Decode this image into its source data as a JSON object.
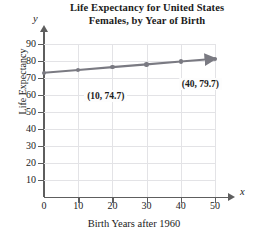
{
  "chart_data": {
    "type": "line",
    "title": "Life Expectancy for United States Females, by Year of Birth",
    "title_line1": "Life Expectancy for United States",
    "title_line2": "Females, by Year of Birth",
    "xlabel": "Birth Years after 1960",
    "ylabel": "Life Expectancy",
    "x_axis_symbol": "x",
    "y_axis_symbol": "y",
    "xlim": [
      0,
      50
    ],
    "ylim": [
      0,
      90
    ],
    "xticks": [
      0,
      10,
      20,
      30,
      40,
      50
    ],
    "yticks": [
      10,
      20,
      30,
      40,
      50,
      60,
      70,
      80,
      90
    ],
    "grid": true,
    "legend": "none",
    "x": [
      0,
      10,
      20,
      30,
      40,
      50
    ],
    "values": [
      73.1,
      74.7,
      76.4,
      78.0,
      79.7,
      81.3
    ],
    "series": [
      {
        "name": "Life expectancy",
        "values": [
          73.1,
          74.7,
          76.4,
          78.0,
          79.7,
          81.3
        ],
        "color": "#7a7a82"
      }
    ],
    "annotations": [
      {
        "label": "(10, 74.7)",
        "x": 10,
        "y": 74.7
      },
      {
        "label": "(40, 79.7)",
        "x": 40,
        "y": 79.7
      }
    ],
    "line_color": "#7a7a82",
    "grid_color": "#e3e3e6",
    "axis_color": "#5e5e5e"
  }
}
